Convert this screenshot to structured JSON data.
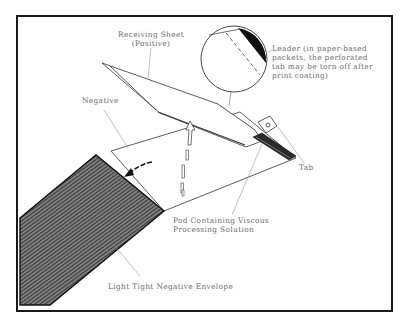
{
  "figure": {
    "labels": {
      "receiving_sheet": {
        "line1": "Receiving Sheet",
        "line2": "(Positive)"
      },
      "leader": {
        "line1": "Leader (in paper-based",
        "line2": "packets, the perforated",
        "line3": "tab may be torn off after",
        "line4": "print coating)"
      },
      "negative": "Negative",
      "tab": "Tab",
      "pod": {
        "line1": "Pod Containing Viscous",
        "line2": "Processing  Solution"
      },
      "envelope": "Light Tight Negative Envelope"
    },
    "icons": {
      "magnifier": "detail-circle-icon",
      "dashed_arrow": "insertion-arrow-icon",
      "curved_arrow": "curved-arrow-icon"
    },
    "colors": {
      "ink": "#1a1a1a",
      "label_text": "#6b6b6b",
      "leader_line": "#9a9a9a",
      "background": "#ffffff"
    }
  }
}
